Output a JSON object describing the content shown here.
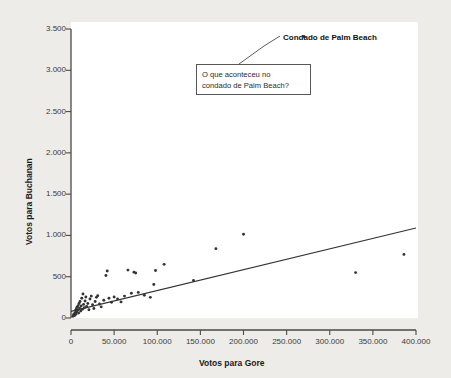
{
  "figure": {
    "background_color": "#eeece8",
    "plot_background_color": "#ffffff"
  },
  "annotations": {
    "outlier_label": "Condado de Palm Beach",
    "callout_line1": "O que aconteceu no",
    "callout_line2": "condado de Palm Beach?"
  },
  "chart_data": {
    "type": "scatter",
    "title": "",
    "xlabel": "Votos para Gore",
    "ylabel": "Votos para Buchanan",
    "xlim": [
      0,
      400000
    ],
    "ylim": [
      0,
      3500
    ],
    "grid": false,
    "legend": null,
    "xticks": [
      0,
      50000,
      100000,
      150000,
      200000,
      250000,
      300000,
      350000,
      400000
    ],
    "xtick_labels": [
      "0",
      "50.000",
      "100.000",
      "150.000",
      "200.000",
      "250.000",
      "300.000",
      "350.000",
      "400.000"
    ],
    "yticks": [
      0,
      500,
      1000,
      1500,
      2000,
      2500,
      3000,
      3500
    ],
    "ytick_labels": [
      "0",
      "500",
      "1.000",
      "1.500",
      "2.000",
      "2.500",
      "3.000",
      "3.500"
    ],
    "marker_color": "#333333",
    "line_color": "#333333",
    "points": [
      {
        "x": 2300,
        "y": 20
      },
      {
        "x": 2900,
        "y": 35
      },
      {
        "x": 3400,
        "y": 50
      },
      {
        "x": 4200,
        "y": 30
      },
      {
        "x": 4800,
        "y": 60
      },
      {
        "x": 5200,
        "y": 90
      },
      {
        "x": 5600,
        "y": 45
      },
      {
        "x": 6100,
        "y": 110
      },
      {
        "x": 6400,
        "y": 75
      },
      {
        "x": 7000,
        "y": 130
      },
      {
        "x": 7600,
        "y": 95
      },
      {
        "x": 8200,
        "y": 150
      },
      {
        "x": 8800,
        "y": 60
      },
      {
        "x": 9300,
        "y": 175
      },
      {
        "x": 9900,
        "y": 120
      },
      {
        "x": 10500,
        "y": 200
      },
      {
        "x": 11200,
        "y": 85
      },
      {
        "x": 11800,
        "y": 145
      },
      {
        "x": 12500,
        "y": 240
      },
      {
        "x": 13200,
        "y": 105
      },
      {
        "x": 13900,
        "y": 290
      },
      {
        "x": 14600,
        "y": 165
      },
      {
        "x": 15400,
        "y": 125
      },
      {
        "x": 16300,
        "y": 205
      },
      {
        "x": 17200,
        "y": 255
      },
      {
        "x": 18100,
        "y": 140
      },
      {
        "x": 19500,
        "y": 175
      },
      {
        "x": 20800,
        "y": 100
      },
      {
        "x": 22000,
        "y": 230
      },
      {
        "x": 23500,
        "y": 265
      },
      {
        "x": 25000,
        "y": 160
      },
      {
        "x": 26500,
        "y": 115
      },
      {
        "x": 28000,
        "y": 200
      },
      {
        "x": 29500,
        "y": 250
      },
      {
        "x": 31000,
        "y": 270
      },
      {
        "x": 33000,
        "y": 170
      },
      {
        "x": 35000,
        "y": 135
      },
      {
        "x": 38000,
        "y": 215
      },
      {
        "x": 40500,
        "y": 515
      },
      {
        "x": 42000,
        "y": 570
      },
      {
        "x": 44000,
        "y": 240
      },
      {
        "x": 47000,
        "y": 190
      },
      {
        "x": 50000,
        "y": 255
      },
      {
        "x": 54000,
        "y": 230
      },
      {
        "x": 58000,
        "y": 195
      },
      {
        "x": 62000,
        "y": 265
      },
      {
        "x": 66000,
        "y": 580
      },
      {
        "x": 70000,
        "y": 300
      },
      {
        "x": 73000,
        "y": 555
      },
      {
        "x": 75000,
        "y": 545
      },
      {
        "x": 78000,
        "y": 310
      },
      {
        "x": 85000,
        "y": 275
      },
      {
        "x": 92000,
        "y": 250
      },
      {
        "x": 96000,
        "y": 405
      },
      {
        "x": 98000,
        "y": 575
      },
      {
        "x": 108000,
        "y": 650
      },
      {
        "x": 142000,
        "y": 455
      },
      {
        "x": 168000,
        "y": 840
      },
      {
        "x": 200000,
        "y": 1015
      },
      {
        "x": 330000,
        "y": 550
      },
      {
        "x": 386000,
        "y": 770
      },
      {
        "x": 270000,
        "y": 3410
      }
    ],
    "outlier_point": {
      "x": 270000,
      "y": 3410,
      "label": "Condado de Palm Beach"
    },
    "regression_line": {
      "x0": 0,
      "y0": 80,
      "x1": 400000,
      "y1": 1090
    }
  }
}
